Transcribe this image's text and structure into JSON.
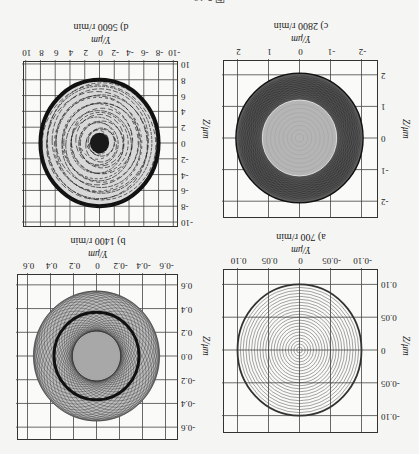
{
  "figure_caption": "图 5-16",
  "chart_data": [
    {
      "type": "scatter",
      "panel": "a",
      "title": "a)  700 r/min",
      "speed": "700 r/min",
      "xlabel": "Y/μm",
      "ylabel": "Z/μm",
      "xticks": [
        "-0.10",
        "-0.05",
        "0",
        "0.05",
        "0.10"
      ],
      "yticks": [
        "-0.10",
        "-0.05",
        "0",
        "0.05",
        "0.10"
      ],
      "xlim": [
        -0.125,
        0.125
      ],
      "ylim": [
        -0.125,
        0.125
      ],
      "grid": true,
      "description": "Concentric circular orbit trajectory spiraling outward from origin",
      "orbit_max_radius": 0.1,
      "ring_count": 22
    },
    {
      "type": "scatter",
      "panel": "b",
      "title": "b) 1400 r/min",
      "speed": "1400 r/min",
      "xlabel": "Y/μm",
      "ylabel": "Z/μm",
      "xticks": [
        "-0.6",
        "-0.4",
        "-0.2",
        "0",
        "0.2",
        "0.4",
        "0.6"
      ],
      "yticks": [
        "-0.6",
        "-0.4",
        "-0.2",
        "0.0",
        "0.2",
        "0.4",
        "0.6"
      ],
      "xlim": [
        -0.7,
        0.7
      ],
      "ylim": [
        -0.7,
        0.7
      ],
      "grid": true,
      "description": "Quasi-periodic orbit with dense dark band; inner light filled core",
      "inner_core_radius": 0.2,
      "dense_band_radius": 0.37,
      "orbit_max_radius": 0.55
    },
    {
      "type": "scatter",
      "panel": "c",
      "title": "c)  2800 r/min",
      "speed": "2800 r/min",
      "xlabel": "Y/μm",
      "ylabel": "Z/μm",
      "xticks": [
        "-2",
        "-1",
        "0",
        "1",
        "2"
      ],
      "yticks": [
        "-2",
        "-1",
        "0",
        "1",
        "2"
      ],
      "xlim": [
        -2.5,
        2.5
      ],
      "ylim": [
        -2.5,
        2.5
      ],
      "grid": true,
      "description": "Dense dark annular orbit band with lighter inner core",
      "inner_core_radius": 1.2,
      "orbit_max_radius": 2.05
    },
    {
      "type": "scatter",
      "panel": "d",
      "title": "d) 5600 r/min",
      "speed": "5600 r/min",
      "xlabel": "Y/μm",
      "ylabel": "Z/μm",
      "xticks": [
        "-10",
        "-8",
        "-6",
        "-4",
        "-2",
        "0",
        "2",
        "4",
        "6",
        "8",
        "10"
      ],
      "yticks": [
        "-10",
        "-8",
        "-6",
        "-4",
        "-2",
        "0",
        "2",
        "4",
        "6",
        "8",
        "10"
      ],
      "xlim": [
        -10.5,
        10.5
      ],
      "ylim": [
        -10.5,
        10.5
      ],
      "grid": true,
      "description": "Chaotic-like dense orbit with thick dark outer ring and dark center",
      "orbit_max_radius": 8.0
    }
  ],
  "panels": {
    "a": {
      "caption": "a)  700 r/min",
      "xlabel": "Y/μm",
      "ylabel": "Z/μm",
      "xticks": [
        "-0.10",
        "-0.05",
        "0",
        "0.05",
        "0.10"
      ],
      "yticks": [
        "-0.10",
        "-0.05",
        "0",
        "0.05",
        "0.10"
      ]
    },
    "b": {
      "caption": "b) 1400 r/min",
      "xlabel": "Y/μm",
      "ylabel": "Z/μm",
      "xticks": [
        "-0.6",
        "-0.4",
        "-0.2",
        "0",
        "0.2",
        "0.4",
        "0.6"
      ],
      "yticks": [
        "-0.6",
        "-0.4",
        "-0.2",
        "0.0",
        "0.2",
        "0.4",
        "0.6"
      ]
    },
    "c": {
      "caption": "c)  2800 r/min",
      "xlabel": "Y/μm",
      "ylabel": "Z/μm",
      "xticks": [
        "-2",
        "-1",
        "0",
        "1",
        "2"
      ],
      "yticks": [
        "-2",
        "-1",
        "0",
        "1",
        "2"
      ]
    },
    "d": {
      "caption": "d) 5600 r/min",
      "xlabel": "Y/μm",
      "ylabel": "Z/μm",
      "xticks": [
        "-10",
        "-8",
        "-6",
        "-4",
        "-2",
        "0",
        "2",
        "4",
        "6",
        "8",
        "10"
      ],
      "yticks": [
        "-10",
        "-8",
        "-6",
        "-4",
        "-2",
        "0",
        "2",
        "4",
        "6",
        "8",
        "10"
      ]
    }
  }
}
